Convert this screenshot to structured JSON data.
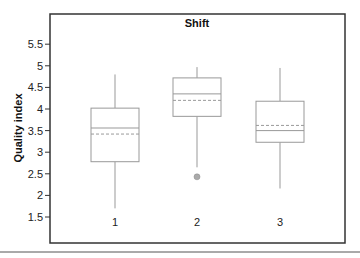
{
  "chart_data": {
    "type": "box",
    "title": "Shift",
    "xlabel": "",
    "ylabel": "Quality index",
    "ylim": [
      1.05,
      6.25
    ],
    "yticks": [
      1.5,
      2,
      2.5,
      3,
      3.5,
      4,
      4.5,
      5,
      5.5
    ],
    "ytick_labels": [
      "1.5",
      "2",
      "2.5",
      "3",
      "3.5",
      "4",
      "4.5",
      "5",
      "5.5"
    ],
    "categories": [
      "1",
      "2",
      "3"
    ],
    "boxes": [
      {
        "category": "1",
        "whisker_low": 1.7,
        "q1": 2.78,
        "median": 3.56,
        "mean": 3.42,
        "q3": 4.02,
        "whisker_high": 4.8,
        "outliers": []
      },
      {
        "category": "2",
        "whisker_low": 2.65,
        "q1": 3.83,
        "median": 4.35,
        "mean": 4.2,
        "q3": 4.72,
        "whisker_high": 4.97,
        "outliers": [
          2.43
        ]
      },
      {
        "category": "3",
        "whisker_low": 2.16,
        "q1": 3.23,
        "median": 3.5,
        "mean": 3.62,
        "q3": 4.18,
        "whisker_high": 4.95,
        "outliers": []
      }
    ],
    "legend": "none",
    "grid": false,
    "mean_line_style": "dashed",
    "median_line_style": "solid"
  },
  "colors": {
    "frame": "#333333",
    "box": "#999999",
    "outlier": "#aaaaaa",
    "rule": "#555555"
  }
}
